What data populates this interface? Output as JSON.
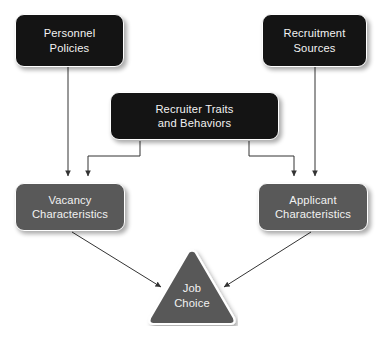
{
  "diagram": {
    "background_color": "#ffffff",
    "colors": {
      "dark_node": "#141414",
      "gray_node": "#595959",
      "node_border": "#ffffff",
      "text": "#f2f2f2",
      "connector": "#333333"
    },
    "nodes": [
      {
        "id": "personnel-policies",
        "shape": "rounded-rectangle",
        "fill": "#141414",
        "line1": "Personnel",
        "line2": "Policies"
      },
      {
        "id": "recruitment-sources",
        "shape": "rounded-rectangle",
        "fill": "#141414",
        "line1": "Recruitment",
        "line2": "Sources"
      },
      {
        "id": "recruiter-traits",
        "shape": "rounded-rectangle",
        "fill": "#141414",
        "line1": "Recruiter Traits",
        "line2": "and Behaviors"
      },
      {
        "id": "vacancy-characteristics",
        "shape": "rounded-rectangle",
        "fill": "#595959",
        "line1": "Vacancy",
        "line2": "Characteristics"
      },
      {
        "id": "applicant-characteristics",
        "shape": "rounded-rectangle",
        "fill": "#595959",
        "line1": "Applicant",
        "line2": "Characteristics"
      },
      {
        "id": "job-choice",
        "shape": "rounded-triangle",
        "fill": "#595959",
        "line1": "Job",
        "line2": "Choice"
      }
    ],
    "edges": [
      {
        "from": "personnel-policies",
        "to": "vacancy-characteristics",
        "style": "straight-arrow"
      },
      {
        "from": "recruitment-sources",
        "to": "applicant-characteristics",
        "style": "straight-arrow"
      },
      {
        "from": "recruiter-traits",
        "to": "vacancy-characteristics",
        "style": "elbow-arrow"
      },
      {
        "from": "recruiter-traits",
        "to": "applicant-characteristics",
        "style": "elbow-arrow"
      },
      {
        "from": "vacancy-characteristics",
        "to": "job-choice",
        "style": "diagonal-arrow"
      },
      {
        "from": "applicant-characteristics",
        "to": "job-choice",
        "style": "diagonal-arrow"
      }
    ]
  }
}
